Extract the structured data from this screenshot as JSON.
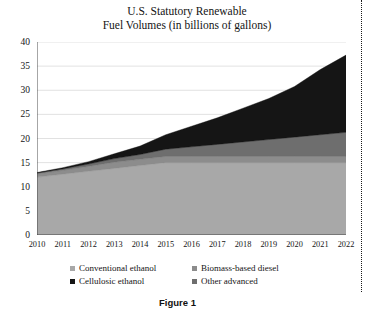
{
  "caption": "Figure 1",
  "chart_data": {
    "type": "area",
    "stacked": true,
    "title": "U.S. Statutory Renewable Fuel Volumes (in billions of gallons)",
    "title_lines": [
      "U.S. Statutory Renewable",
      "Fuel Volumes (in billions of gallons)"
    ],
    "xlabel": "",
    "ylabel": "",
    "ylim": [
      0,
      40
    ],
    "yticks": [
      0,
      5,
      10,
      15,
      20,
      25,
      30,
      35,
      40
    ],
    "grid": true,
    "grid_axis": "y",
    "legend_position": "bottom",
    "categories": [
      2010,
      2011,
      2012,
      2013,
      2014,
      2015,
      2016,
      2017,
      2018,
      2019,
      2020,
      2021,
      2022
    ],
    "x": [
      "2010",
      "2011",
      "2012",
      "2013",
      "2014",
      "2015",
      "2016",
      "2017",
      "2018",
      "2019",
      "2020",
      "2021",
      "2022"
    ],
    "series": [
      {
        "name": "Conventional ethanol",
        "color": "#a8a8a8",
        "values": [
          12.0,
          12.6,
          13.2,
          13.8,
          14.4,
          15.0,
          15.0,
          15.0,
          15.0,
          15.0,
          15.0,
          15.0,
          15.0
        ]
      },
      {
        "name": "Biomass-based diesel",
        "color": "#8c8c8c",
        "values": [
          0.65,
          0.8,
          1.0,
          1.28,
          1.28,
          1.28,
          1.28,
          1.28,
          1.28,
          1.28,
          1.28,
          1.28,
          1.28
        ]
      },
      {
        "name": "Other advanced",
        "color": "#6e6e6e",
        "values": [
          0.2,
          0.3,
          0.5,
          0.75,
          1.0,
          1.5,
          2.0,
          2.5,
          3.0,
          3.5,
          4.0,
          4.5,
          5.0
        ]
      },
      {
        "name": "Cellulosic ethanol",
        "color": "#151515",
        "values": [
          0.1,
          0.25,
          0.5,
          1.0,
          1.75,
          3.0,
          4.25,
          5.5,
          7.0,
          8.5,
          10.5,
          13.5,
          16.0
        ]
      }
    ],
    "totals": [
      12.95,
      13.95,
      15.2,
      16.83,
      18.43,
      20.78,
      22.53,
      24.28,
      26.28,
      28.28,
      30.78,
      34.28,
      37.28
    ]
  }
}
